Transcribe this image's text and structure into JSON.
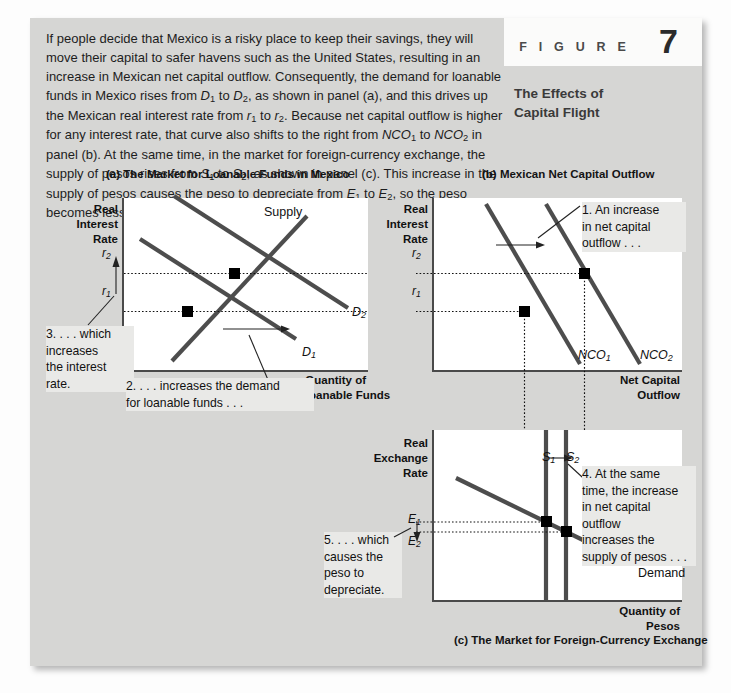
{
  "figure": {
    "label_word": "F I G U R E",
    "number": "7"
  },
  "intro_paragraph": "If people decide that Mexico is a risky place to keep their savings, they will move their capital to safer havens such as the United States, resulting in an increase in Mexican net capital outflow. Consequently, the demand for loanable funds in Mexico rises from D1 to D2, as shown in panel (a), and this drives up the Mexican real interest rate from r1 to r2. Because net capital outflow is higher for any interest rate, that curve also shifts to the right from NCO1 to NCO2 in panel (b). At the same time, in the market for foreign-currency exchange, the supply of pesos rises from S1 to S2, as shown in panel (c). This increase in the supply of pesos causes the peso to depreciate from E1 to E2, so the peso becomes less valuable compared to other currencies.",
  "panel_a": {
    "title": "(a) The Market for Loanable Funds in Mexico",
    "y_axis_label": "Real\nInterest\nRate",
    "x_axis_label": "Quantity of\nLoanable Funds",
    "ticks": [
      "r2",
      "r1"
    ],
    "curves": [
      "Supply",
      "D2",
      "D1"
    ],
    "note_left": "3. . . . which\nincreases\nthe interest\nrate.",
    "note_bottom": "2. . . . increases the demand\nfor loanable funds . . ."
  },
  "panel_b": {
    "title": "(b) Mexican Net Capital Outflow",
    "y_axis_label": "Real\nInterest\nRate",
    "x_axis_label": "Net Capital\nOutflow",
    "ticks": [
      "r2",
      "r1"
    ],
    "curves": [
      "NCO1",
      "NCO2"
    ],
    "note": "1. An increase\nin net capital\noutflow . . ."
  },
  "panel_c": {
    "title": "(c) The Market for Foreign-Currency Exchange",
    "y_axis_label": "Real\nExchange\nRate",
    "x_axis_label": "Quantity of\nPesos",
    "ticks": [
      "E1",
      "E2"
    ],
    "curves": [
      "S1",
      "S2",
      "Demand"
    ],
    "note_right": "4. At the same\ntime, the increase\nin net capital\noutflow\nincreases the\nsupply of pesos . . .",
    "note_left": "5. . . . which\ncauses the\npeso to\ndepreciate."
  },
  "colors": {
    "card_background": "#d6d6d4",
    "plot_background": "#ffffff",
    "curve": "#4d4d4d",
    "axis": "#4a4a4a",
    "note_background": "#e9e9e7",
    "text": "#111111"
  }
}
